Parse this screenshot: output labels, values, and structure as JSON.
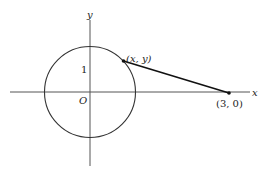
{
  "diagram": {
    "type": "coordinate-geometry",
    "axes": {
      "x_label": "x",
      "y_label": "y",
      "origin_label": "O",
      "tick_label_y": "1"
    },
    "circle": {
      "center_label": "O",
      "radius": 1
    },
    "points": [
      {
        "label": "(x, y)",
        "on": "circle"
      },
      {
        "label": "(3, 0)",
        "on": "x-axis"
      }
    ],
    "segment": {
      "from": "(x, y)",
      "to": "(3, 0)"
    },
    "colors": {
      "stroke": "#111111",
      "axis": "#555555",
      "background": "#ffffff"
    }
  }
}
